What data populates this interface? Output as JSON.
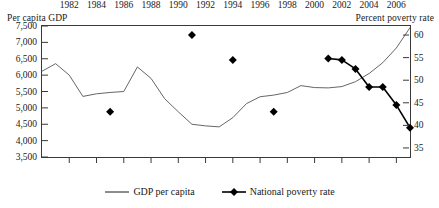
{
  "chart_data": {
    "type": "line",
    "title": "",
    "xlabel": "",
    "ylabel": "Per capita GDP",
    "y2label": "Percent poverty rate",
    "xlim": [
      1980,
      2007
    ],
    "ylim": [
      3500,
      7500
    ],
    "y2lim": [
      33,
      62
    ],
    "grid": false,
    "legend_position": "bottom-center",
    "x_tick_labels": [
      "1982",
      "1984",
      "1986",
      "1988",
      "1990",
      "1992",
      "1994",
      "1996",
      "1998",
      "2000",
      "2002",
      "2004",
      "2006"
    ],
    "x_tick_values": [
      1982,
      1984,
      1986,
      1988,
      1990,
      1992,
      1994,
      1996,
      1998,
      2000,
      2002,
      2004,
      2006
    ],
    "y_tick_labels": [
      "3,500",
      "4,000",
      "4,500",
      "5,000",
      "5,500",
      "6,000",
      "6,500",
      "7,000",
      "7,500"
    ],
    "y_tick_values": [
      3500,
      4000,
      4500,
      5000,
      5500,
      6000,
      6500,
      7000,
      7500
    ],
    "y2_tick_labels": [
      "35",
      "40",
      "45",
      "50",
      "55",
      "60"
    ],
    "y2_tick_values": [
      35,
      40,
      45,
      50,
      55,
      60
    ],
    "series": [
      {
        "name": "GDP per capita",
        "axis": "left",
        "style": "line",
        "marker": "none",
        "color": "#555555",
        "x": [
          1980,
          1981,
          1982,
          1983,
          1984,
          1985,
          1986,
          1987,
          1988,
          1989,
          1990,
          1991,
          1992,
          1993,
          1994,
          1995,
          1996,
          1997,
          1998,
          1999,
          2000,
          2001,
          2002,
          2003,
          2004,
          2005,
          2006,
          2007
        ],
        "values": [
          6120,
          6350,
          6000,
          5350,
          5430,
          5470,
          5500,
          6250,
          5900,
          5280,
          4880,
          4500,
          4450,
          4420,
          4700,
          5130,
          5340,
          5390,
          5470,
          5680,
          5620,
          5610,
          5650,
          5800,
          6050,
          6380,
          6830,
          7450
        ]
      },
      {
        "name": "National poverty rate",
        "axis": "right",
        "style": "line-markers",
        "marker": "diamond",
        "color": "#000000",
        "x": [
          2001,
          2002,
          2003,
          2004,
          2005,
          2006,
          2007
        ],
        "values": [
          54.8,
          54.5,
          52.5,
          48.5,
          48.5,
          44.5,
          39.5
        ]
      },
      {
        "name": "National poverty rate (survey points)",
        "axis": "right",
        "style": "markers-only",
        "marker": "diamond",
        "color": "#000000",
        "x": [
          1985,
          1991,
          1994,
          1997
        ],
        "values": [
          43.0,
          60.0,
          54.5,
          43.0
        ]
      }
    ]
  },
  "axes": {
    "left_title": "Per capita GDP",
    "right_title": "Percent poverty rate"
  },
  "legend": {
    "items": [
      {
        "label": "GDP per capita",
        "marker": "line"
      },
      {
        "label": "National poverty rate",
        "marker": "line-diamond"
      }
    ]
  }
}
